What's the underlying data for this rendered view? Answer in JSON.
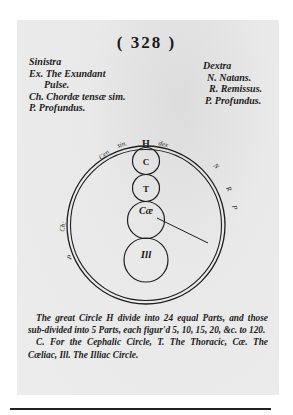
{
  "page": {
    "number": "( 328 )"
  },
  "left_column": {
    "heading": "Sinistra",
    "lines": [
      "Ex. The Exundant",
      "Pulse.",
      "Ch. Chordæ tensæ sim.",
      "P. Profundus."
    ]
  },
  "right_column": {
    "heading": "Dextra",
    "lines": [
      "N. Natans.",
      "R. Remissus.",
      "P. Profundus."
    ]
  },
  "diagram": {
    "outer_circle_label": "H",
    "ring_labels": {
      "top_left": [
        "Cen",
        "sin."
      ],
      "top_right": "dex",
      "right": [
        "N",
        "R",
        "P"
      ],
      "left": [
        "Ch:",
        "P"
      ]
    },
    "inner_circles": [
      {
        "label": "C",
        "name": "Cephalic"
      },
      {
        "label": "T",
        "name": "Thoracic"
      },
      {
        "label": "Cæ",
        "name": "Cæliac"
      },
      {
        "label": "Ill",
        "name": "Illiac"
      }
    ]
  },
  "caption": {
    "line1": "The great Circle H divide into 24 equal Parts, and those sub-divided into 5 Parts, each figur'd 5, 10, 15, 20, &c. to 120.",
    "line2": "C. For the Cephalic Circle, T. The Thoracic, Cæ. The Cæliac, Ill. The Illiac Circle."
  }
}
